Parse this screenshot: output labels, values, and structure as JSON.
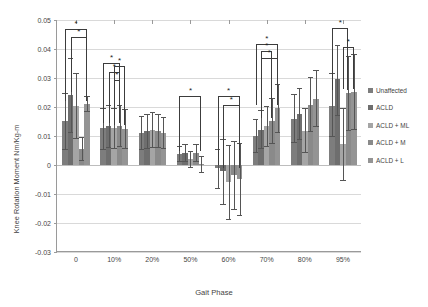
{
  "chart_data": {
    "type": "bar",
    "title": "",
    "xlabel": "Gait Phase",
    "ylabel": "Knee Rotation Moment Nm/Kg-m",
    "categories": [
      "0",
      "10%",
      "20%",
      "50%",
      "60%",
      "70%",
      "80%",
      "95%"
    ],
    "ylim": [
      -0.03,
      0.05
    ],
    "yticks": [
      "0.05",
      "0.04",
      "0.03",
      "0.02",
      "0.01",
      "0",
      "-0.01",
      "-0.02",
      "-0.03"
    ],
    "ytick_values": [
      0.05,
      0.04,
      0.03,
      0.02,
      0.01,
      0,
      -0.01,
      -0.02,
      -0.03
    ],
    "grid": true,
    "legend_position": "right",
    "series": [
      {
        "name": "Unaffected",
        "color": "#7d7d7d",
        "values": [
          0.0152,
          0.0126,
          0.011,
          0.0037,
          -0.0012,
          0.01,
          0.016,
          0.0205
        ],
        "err_low": [
          0.01,
          0.0074,
          0.006,
          0.0028,
          0.007,
          0.0058,
          0.0085,
          0.011
        ],
        "err_high": [
          0.0098,
          0.007,
          0.0058,
          0.0027,
          0.0068,
          0.006,
          0.0085,
          0.0112
        ]
      },
      {
        "name": "ACLD",
        "color": "#6e6e6e",
        "values": [
          0.024,
          0.0133,
          0.0116,
          0.0042,
          -0.0022,
          0.0122,
          0.0175,
          0.0295
        ],
        "err_low": [
          0.013,
          0.0075,
          0.0062,
          0.0032,
          0.0115,
          0.0068,
          0.009,
          0.0125
        ],
        "err_high": [
          0.0128,
          0.0073,
          0.006,
          0.003,
          0.0112,
          0.0068,
          0.009,
          0.0118
        ]
      },
      {
        "name": "ACLD + ML",
        "color": "#a5a5a5",
        "values": [
          0.0205,
          0.0128,
          0.0122,
          0.002,
          -0.0058,
          0.0133,
          0.0118,
          0.0072
        ],
        "err_low": [
          0.0115,
          0.0072,
          0.0064,
          0.003,
          0.0132,
          0.0072,
          0.0078,
          0.0128
        ],
        "err_high": [
          0.0112,
          0.007,
          0.0062,
          0.0028,
          0.0128,
          0.0072,
          0.0078,
          0.0125
        ]
      },
      {
        "name": "ACLD + M",
        "color": "#8a8a8a",
        "values": [
          0.0055,
          0.0135,
          0.0118,
          0.0041,
          -0.0035,
          0.0152,
          0.0208,
          0.0248
        ],
        "err_low": [
          0.0042,
          0.0074,
          0.006,
          0.003,
          0.012,
          0.0078,
          0.0095,
          0.013
        ],
        "err_high": [
          0.004,
          0.0072,
          0.0058,
          0.003,
          0.0118,
          0.0078,
          0.0095,
          0.0128
        ]
      },
      {
        "name": "ACLD + L",
        "color": "#949494",
        "values": [
          0.0212,
          0.0125,
          0.0112,
          0.0002,
          -0.0048,
          0.0195,
          0.0228,
          0.0252
        ],
        "err_low": [
          0.0028,
          0.007,
          0.0056,
          0.003,
          0.0128,
          0.0085,
          0.0098,
          0.0132
        ],
        "err_high": [
          0.0026,
          0.0068,
          0.0055,
          0.0028,
          0.0125,
          0.0085,
          0.0098,
          0.013
        ]
      }
    ],
    "annotations": [
      {
        "label": "*",
        "group": 0,
        "from": 0,
        "to": 4,
        "y": 0.0468
      },
      {
        "label": "*",
        "group": 0,
        "from": 1,
        "to": 4,
        "y": 0.044
      },
      {
        "label": "*",
        "group": 1,
        "from": 0,
        "to": 3,
        "y": 0.0352
      },
      {
        "label": "*",
        "group": 1,
        "from": 1,
        "to": 3,
        "y": 0.0322
      },
      {
        "label": "*",
        "group": 1,
        "from": 2,
        "to": 4,
        "y": 0.034
      },
      {
        "label": "*",
        "group": 1,
        "from": 2,
        "to": 3,
        "y": 0.0292
      },
      {
        "label": "*",
        "group": 3,
        "from": 0,
        "to": 4,
        "y": 0.0238
      },
      {
        "label": "*",
        "group": 4,
        "from": 0,
        "to": 4,
        "y": 0.0238
      },
      {
        "label": "*",
        "group": 4,
        "from": 1,
        "to": 4,
        "y": 0.0208
      },
      {
        "label": "*",
        "group": 5,
        "from": 0,
        "to": 4,
        "y": 0.0418
      },
      {
        "label": "*",
        "group": 5,
        "from": 1,
        "to": 3,
        "y": 0.0392
      },
      {
        "label": "*",
        "group": 5,
        "from": 1,
        "to": 4,
        "y": 0.0368
      },
      {
        "label": "*",
        "group": 7,
        "from": 0,
        "to": 3,
        "y": 0.0472
      },
      {
        "label": "*",
        "group": 7,
        "from": 2,
        "to": 4,
        "y": 0.0408
      }
    ]
  },
  "legend": {
    "items": [
      {
        "label": "Unaffected",
        "color": "#7d7d7d"
      },
      {
        "label": "ACLD",
        "color": "#6e6e6e"
      },
      {
        "label": "ACLD + ML",
        "color": "#a5a5a5"
      },
      {
        "label": "ACLD + M",
        "color": "#8a8a8a"
      },
      {
        "label": "ACLD + L",
        "color": "#949494"
      }
    ]
  }
}
